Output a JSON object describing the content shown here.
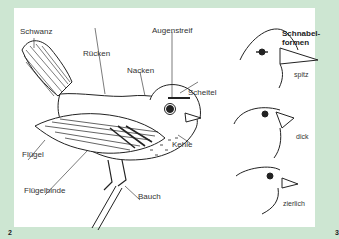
{
  "figure": {
    "bird_labels": {
      "tail": "Schwanz",
      "back": "Rücken",
      "nape": "Nacken",
      "eyestripe": "Augenstreif",
      "crown": "Scheitel",
      "throat": "Kehle",
      "wing": "Flügel",
      "wingbar": "Flügelbinde",
      "belly": "Bauch"
    },
    "beak_shapes": {
      "title_line1": "Schnabel-",
      "title_line2": "formen",
      "items": [
        {
          "label": "spitz"
        },
        {
          "label": "dick"
        },
        {
          "label": "zierlich"
        }
      ]
    }
  },
  "page_numbers": {
    "left": "2",
    "right": "3"
  },
  "colors": {
    "background_border": "#cde6d2",
    "page": "#ffffff",
    "ink": "#222222"
  }
}
